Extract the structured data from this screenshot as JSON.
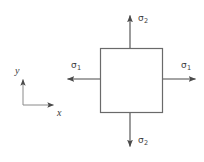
{
  "figure": {
    "name": "biaxial-stress-element",
    "background_color": "#ffffff",
    "line_color": "#555555",
    "text_color": "#3a3a3a"
  },
  "element": {
    "shape": "square",
    "x": 100,
    "y": 48,
    "width": 63,
    "height": 65
  },
  "axes": {
    "origin_x": 23,
    "origin_y": 105,
    "y_label": "y",
    "x_label": "x",
    "y_tip_y": 78,
    "x_tip_x": 55
  },
  "arrows": [
    {
      "name": "sigma2-top",
      "direction": "up",
      "label_symbol": "σ",
      "label_subscript": "2",
      "from_x": 130,
      "from_y": 48,
      "to_x": 130,
      "to_y": 14
    },
    {
      "name": "sigma2-bottom",
      "direction": "down",
      "label_symbol": "σ",
      "label_subscript": "2",
      "from_x": 130,
      "from_y": 113,
      "to_x": 130,
      "to_y": 148
    },
    {
      "name": "sigma1-left",
      "direction": "left",
      "label_symbol": "σ",
      "label_subscript": "1",
      "from_x": 100,
      "from_y": 79,
      "to_x": 66,
      "to_y": 79
    },
    {
      "name": "sigma1-right",
      "direction": "right",
      "label_symbol": "σ",
      "label_subscript": "1",
      "from_x": 163,
      "from_y": 79,
      "to_x": 197,
      "to_y": 79
    }
  ],
  "labels": {
    "sigma2_top": {
      "symbol": "σ",
      "subscript": "2"
    },
    "sigma2_bottom": {
      "symbol": "σ",
      "subscript": "2"
    },
    "sigma1_left": {
      "symbol": "σ",
      "subscript": "1"
    },
    "sigma1_right": {
      "symbol": "σ",
      "subscript": "1"
    },
    "axis_y": "y",
    "axis_x": "x"
  }
}
